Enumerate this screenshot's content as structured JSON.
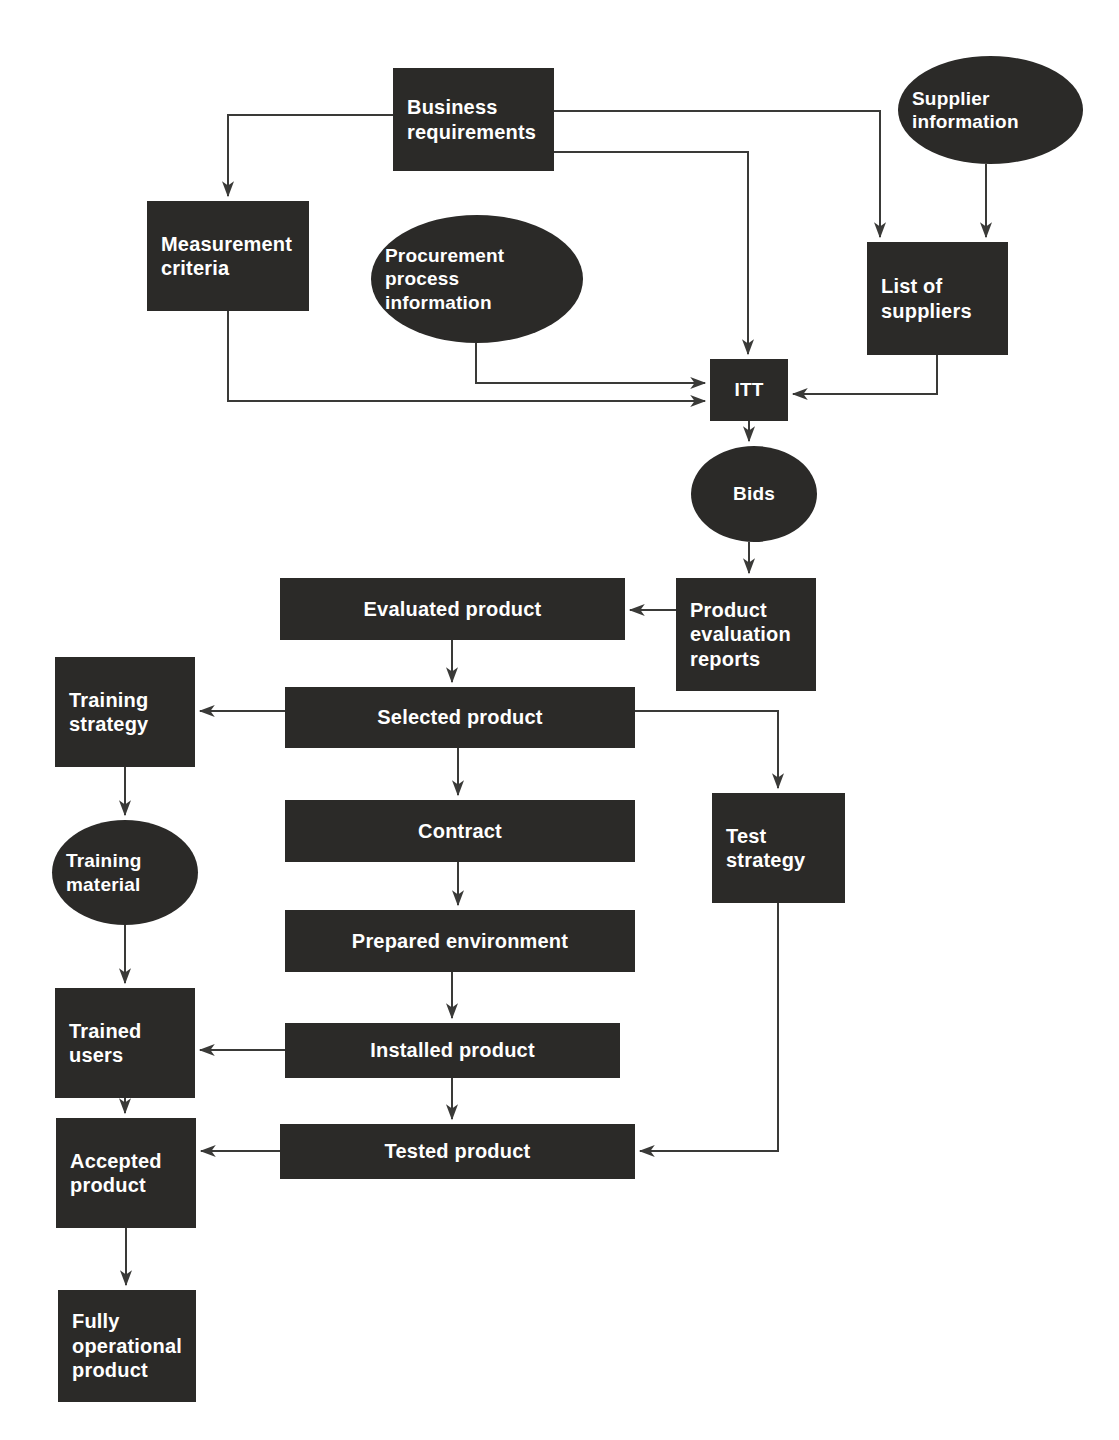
{
  "diagram": {
    "background_color": "#ffffff",
    "node_fill_color": "#2b2a28",
    "node_text_color": "#ffffff",
    "edge_color": "#3a3a38",
    "nodes": [
      {
        "id": "business-requirements",
        "label": "Business\nrequirements",
        "shape": "rect",
        "x": 393,
        "y": 68,
        "w": 161,
        "h": 103,
        "align": "left",
        "size": "fs20"
      },
      {
        "id": "supplier-information",
        "label": "Supplier\ninformation",
        "shape": "ellipse",
        "x": 898,
        "y": 56,
        "w": 185,
        "h": 108,
        "align": "left",
        "size": "fs19"
      },
      {
        "id": "measurement-criteria",
        "label": "Measurement\ncriteria",
        "shape": "rect",
        "x": 147,
        "y": 201,
        "w": 162,
        "h": 110,
        "align": "left",
        "size": "fs20"
      },
      {
        "id": "procurement-process-information",
        "label": "Procurement\nprocess\ninformation",
        "shape": "ellipse",
        "x": 371,
        "y": 215,
        "w": 212,
        "h": 128,
        "align": "left",
        "size": "fs19"
      },
      {
        "id": "list-of-suppliers",
        "label": "List of\nsuppliers",
        "shape": "rect",
        "x": 867,
        "y": 242,
        "w": 141,
        "h": 113,
        "align": "left",
        "size": "fs20"
      },
      {
        "id": "itt",
        "label": "ITT",
        "shape": "rect",
        "x": 710,
        "y": 359,
        "w": 78,
        "h": 62,
        "align": "center",
        "size": "fs19"
      },
      {
        "id": "bids",
        "label": "Bids",
        "shape": "ellipse",
        "x": 691,
        "y": 446,
        "w": 126,
        "h": 96,
        "align": "center",
        "size": "fs19"
      },
      {
        "id": "product-evaluation-reports",
        "label": "Product\nevaluation\nreports",
        "shape": "rect",
        "x": 676,
        "y": 578,
        "w": 140,
        "h": 113,
        "align": "left",
        "size": "fs20"
      },
      {
        "id": "evaluated-product",
        "label": "Evaluated product",
        "shape": "rect",
        "x": 280,
        "y": 578,
        "w": 345,
        "h": 62,
        "align": "center",
        "size": "fs20"
      },
      {
        "id": "training-strategy",
        "label": "Training\nstrategy",
        "shape": "rect",
        "x": 55,
        "y": 657,
        "w": 140,
        "h": 110,
        "align": "left",
        "size": "fs20"
      },
      {
        "id": "selected-product",
        "label": "Selected product",
        "shape": "rect",
        "x": 285,
        "y": 687,
        "w": 350,
        "h": 61,
        "align": "center",
        "size": "fs20"
      },
      {
        "id": "test-strategy",
        "label": "Test\nstrategy",
        "shape": "rect",
        "x": 712,
        "y": 793,
        "w": 133,
        "h": 110,
        "align": "left",
        "size": "fs20"
      },
      {
        "id": "training-material",
        "label": "Training\nmaterial",
        "shape": "ellipse",
        "x": 52,
        "y": 820,
        "w": 146,
        "h": 105,
        "align": "left",
        "size": "fs19"
      },
      {
        "id": "contract",
        "label": "Contract",
        "shape": "rect",
        "x": 285,
        "y": 800,
        "w": 350,
        "h": 62,
        "align": "center",
        "size": "fs20"
      },
      {
        "id": "prepared-environment",
        "label": "Prepared environment",
        "shape": "rect",
        "x": 285,
        "y": 910,
        "w": 350,
        "h": 62,
        "align": "center",
        "size": "fs20"
      },
      {
        "id": "trained-users",
        "label": "Trained\nusers",
        "shape": "rect",
        "x": 55,
        "y": 988,
        "w": 140,
        "h": 110,
        "align": "left",
        "size": "fs20"
      },
      {
        "id": "installed-product",
        "label": "Installed product",
        "shape": "rect",
        "x": 285,
        "y": 1023,
        "w": 335,
        "h": 55,
        "align": "center",
        "size": "fs20"
      },
      {
        "id": "accepted-product",
        "label": "Accepted\nproduct",
        "shape": "rect",
        "x": 56,
        "y": 1118,
        "w": 140,
        "h": 110,
        "align": "left",
        "size": "fs20"
      },
      {
        "id": "tested-product",
        "label": "Tested product",
        "shape": "rect",
        "x": 280,
        "y": 1124,
        "w": 355,
        "h": 55,
        "align": "center",
        "size": "fs20"
      },
      {
        "id": "fully-operational-product",
        "label": "Fully\noperational\nproduct",
        "shape": "rect",
        "x": 58,
        "y": 1290,
        "w": 138,
        "h": 112,
        "align": "left",
        "size": "fs20"
      }
    ],
    "edges": [
      {
        "from": "business-requirements",
        "to": "measurement-criteria",
        "path": "M 393 115 L 228 115 L 228 196"
      },
      {
        "from": "business-requirements",
        "to": "list-of-suppliers",
        "path": "M 554 111 L 880 111 L 880 237"
      },
      {
        "from": "business-requirements",
        "to": "itt",
        "path": "M 554 152 L 748 152 L 748 354"
      },
      {
        "from": "supplier-information",
        "to": "list-of-suppliers",
        "path": "M 986 164 L 986 237"
      },
      {
        "from": "procurement-process-information",
        "to": "itt",
        "path": "M 476 343 L 476 383 L 705 383"
      },
      {
        "from": "measurement-criteria",
        "to": "itt",
        "path": "M 228 311 L 228 401 L 705 401"
      },
      {
        "from": "list-of-suppliers",
        "to": "itt",
        "path": "M 937 355 L 937 394 L 793 394"
      },
      {
        "from": "itt",
        "to": "bids",
        "path": "M 749 421 L 749 441"
      },
      {
        "from": "bids",
        "to": "product-evaluation-reports",
        "path": "M 749 542 L 749 573"
      },
      {
        "from": "product-evaluation-reports",
        "to": "evaluated-product",
        "path": "M 676 610 L 630 610"
      },
      {
        "from": "evaluated-product",
        "to": "selected-product",
        "path": "M 452 640 L 452 682"
      },
      {
        "from": "selected-product",
        "to": "training-strategy",
        "path": "M 285 711 L 200 711"
      },
      {
        "from": "selected-product",
        "to": "test-strategy",
        "path": "M 635 711 L 778 711 L 778 788"
      },
      {
        "from": "selected-product",
        "to": "contract",
        "path": "M 458 748 L 458 795"
      },
      {
        "from": "training-strategy",
        "to": "training-material",
        "path": "M 125 767 L 125 815"
      },
      {
        "from": "contract",
        "to": "prepared-environment",
        "path": "M 458 862 L 458 905"
      },
      {
        "from": "training-material",
        "to": "trained-users",
        "path": "M 125 925 L 125 983"
      },
      {
        "from": "prepared-environment",
        "to": "installed-product",
        "path": "M 452 972 L 452 1018"
      },
      {
        "from": "installed-product",
        "to": "trained-users",
        "path": "M 285 1050 L 200 1050"
      },
      {
        "from": "installed-product",
        "to": "tested-product",
        "path": "M 452 1078 L 452 1119"
      },
      {
        "from": "trained-users",
        "to": "accepted-product",
        "path": "M 125 1098 L 125 1113"
      },
      {
        "from": "tested-product",
        "to": "accepted-product",
        "path": "M 280 1151 L 201 1151"
      },
      {
        "from": "test-strategy",
        "to": "tested-product",
        "path": "M 778 903 L 778 1151 L 640 1151"
      },
      {
        "from": "accepted-product",
        "to": "fully-operational-product",
        "path": "M 126 1228 L 126 1285"
      }
    ]
  }
}
